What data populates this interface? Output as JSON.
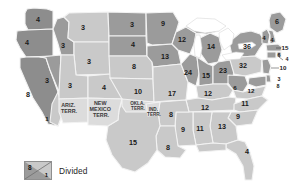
{
  "map": {
    "title": "United States electoral vote map with territories",
    "colors": {
      "dark_gray": "#8d8d8d",
      "mid_gray": "#9b9b9b",
      "light_gray": "#c9c9c9",
      "pale_gray": "#d6d6d6",
      "territory_fill": "#dcdcdc",
      "border": "#f2f2f2",
      "water": "#ffffff",
      "text": "#1a1a1a"
    },
    "states": [
      {
        "id": "washington",
        "value": "4",
        "shade": "dark",
        "x": 38,
        "y": 20
      },
      {
        "id": "oregon",
        "value": "4",
        "shade": "dark",
        "x": 27,
        "y": 43
      },
      {
        "id": "california",
        "value": "8",
        "shade": "dark",
        "x": 28,
        "y": 95
      },
      {
        "id": "california-split",
        "value": "1",
        "shade": "light",
        "x": 47,
        "y": 119
      },
      {
        "id": "nevada",
        "value": "3",
        "shade": "mid",
        "x": 47,
        "y": 81
      },
      {
        "id": "idaho",
        "value": "3",
        "shade": "mid",
        "x": 63,
        "y": 46
      },
      {
        "id": "montana",
        "value": "3",
        "shade": "light",
        "x": 83,
        "y": 28
      },
      {
        "id": "wyoming",
        "value": "3",
        "shade": "light",
        "x": 89,
        "y": 62
      },
      {
        "id": "utah",
        "value": "3",
        "shade": "light",
        "x": 70,
        "y": 86
      },
      {
        "id": "colorado",
        "value": "4",
        "shade": "light",
        "x": 104,
        "y": 88
      },
      {
        "id": "north-dakota",
        "value": "3",
        "shade": "mid",
        "x": 132,
        "y": 25
      },
      {
        "id": "south-dakota",
        "value": "4",
        "shade": "mid",
        "x": 133,
        "y": 45
      },
      {
        "id": "nebraska",
        "value": "8",
        "shade": "light",
        "x": 134,
        "y": 67
      },
      {
        "id": "kansas",
        "value": "10",
        "shade": "light",
        "x": 138,
        "y": 92
      },
      {
        "id": "minnesota",
        "value": "9",
        "shade": "mid",
        "x": 163,
        "y": 24
      },
      {
        "id": "iowa",
        "value": "13",
        "shade": "mid",
        "x": 165,
        "y": 57
      },
      {
        "id": "missouri",
        "value": "17",
        "shade": "light",
        "x": 172,
        "y": 94
      },
      {
        "id": "wisconsin",
        "value": "12",
        "shade": "mid",
        "x": 182,
        "y": 40
      },
      {
        "id": "michigan",
        "value": "14",
        "shade": "mid",
        "x": 211,
        "y": 47
      },
      {
        "id": "illinois",
        "value": "24",
        "shade": "mid",
        "x": 188,
        "y": 73
      },
      {
        "id": "indiana",
        "value": "15",
        "shade": "mid",
        "x": 206,
        "y": 76
      },
      {
        "id": "ohio",
        "value": "23",
        "shade": "mid",
        "x": 223,
        "y": 71
      },
      {
        "id": "new-york",
        "value": "36",
        "shade": "mid",
        "x": 247,
        "y": 47
      },
      {
        "id": "pennsylvania",
        "value": "32",
        "shade": "light",
        "x": 243,
        "y": 66
      },
      {
        "id": "maine",
        "value": "6",
        "shade": "mid",
        "x": 277,
        "y": 22
      },
      {
        "id": "vermont",
        "value": "4",
        "shade": "mid",
        "x": 264,
        "y": 38
      },
      {
        "id": "new-hampshire",
        "value": "4",
        "shade": "mid",
        "x": 272,
        "y": 40
      },
      {
        "id": "massachusetts",
        "value": "15",
        "shade": "mid",
        "x": 285,
        "y": 48
      },
      {
        "id": "rhode-island",
        "value": "4",
        "shade": "mid",
        "x": 286,
        "y": 60
      },
      {
        "id": "connecticut",
        "value": "6",
        "shade": "mid",
        "x": 278,
        "y": 57
      },
      {
        "id": "new-jersey",
        "value": "10",
        "shade": "mid",
        "x": 282,
        "y": 68
      },
      {
        "id": "delaware",
        "value": "3",
        "shade": "mid",
        "x": 278,
        "y": 81
      },
      {
        "id": "maryland",
        "value": "8",
        "shade": "mid",
        "x": 277,
        "y": 87
      },
      {
        "id": "west-virginia",
        "value": "6",
        "shade": "mid",
        "x": 235,
        "y": 88
      },
      {
        "id": "virginia",
        "value": "12",
        "shade": "light",
        "x": 251,
        "y": 91
      },
      {
        "id": "kentucky",
        "value": "12",
        "shade": "light",
        "x": 208,
        "y": 94
      },
      {
        "id": "tennessee",
        "value": "12",
        "shade": "light",
        "x": 205,
        "y": 108
      },
      {
        "id": "north-carolina",
        "value": "11",
        "shade": "light",
        "x": 245,
        "y": 104
      },
      {
        "id": "south-carolina",
        "value": "9",
        "shade": "light",
        "x": 238,
        "y": 117
      },
      {
        "id": "georgia",
        "value": "13",
        "shade": "light",
        "x": 222,
        "y": 127
      },
      {
        "id": "alabama",
        "value": "11",
        "shade": "light",
        "x": 200,
        "y": 129
      },
      {
        "id": "mississippi",
        "value": "9",
        "shade": "light",
        "x": 183,
        "y": 130
      },
      {
        "id": "arkansas",
        "value": "8",
        "shade": "light",
        "x": 171,
        "y": 115
      },
      {
        "id": "louisiana",
        "value": "8",
        "shade": "light",
        "x": 168,
        "y": 148
      },
      {
        "id": "florida",
        "value": "4",
        "shade": "light",
        "x": 247,
        "y": 152
      },
      {
        "id": "texas",
        "value": "15",
        "shade": "light",
        "x": 133,
        "y": 143
      }
    ],
    "territories": [
      {
        "id": "arizona-territory",
        "lines": [
          "ARIZ.",
          "TERR."
        ],
        "x": 69,
        "y": 109
      },
      {
        "id": "new-mexico-territory",
        "lines": [
          "NEW",
          "MEXICO",
          "TERR."
        ],
        "x": 101,
        "y": 112
      },
      {
        "id": "oklahoma-territory",
        "lines": [
          "OKLA.",
          "TERR."
        ],
        "x": 139,
        "y": 106
      },
      {
        "id": "indian-territory",
        "lines": [
          "IND.",
          "TERR."
        ],
        "x": 155,
        "y": 114
      }
    ]
  },
  "legend": {
    "label": "Divided",
    "upper_value": "8",
    "lower_value": "1"
  }
}
